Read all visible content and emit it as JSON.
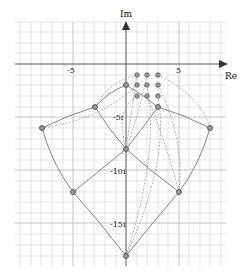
{
  "axes": {
    "x_label": "Re",
    "y_label": "Im",
    "x_ticks": [
      {
        "value": -5,
        "label": "-5"
      },
      {
        "value": 5,
        "label": "5"
      }
    ],
    "y_ticks": [
      {
        "value": -5,
        "label": "-5i"
      },
      {
        "value": -10,
        "label": "-10i"
      },
      {
        "value": -15,
        "label": "-15i"
      }
    ]
  },
  "colors": {
    "grid": "#d8d8d8",
    "axis": "#555555",
    "solid_curve": "#777777",
    "dashed_curve": "#999999",
    "point_fill": "#999999",
    "point_stroke": "#555555"
  },
  "grid_points": [
    {
      "re": 1,
      "im": -1
    },
    {
      "re": 2,
      "im": -1
    },
    {
      "re": 3,
      "im": -1
    },
    {
      "re": 1,
      "im": -2
    },
    {
      "re": 2,
      "im": -2
    },
    {
      "re": 3,
      "im": -2
    },
    {
      "re": 1,
      "im": -3
    },
    {
      "re": 2,
      "im": -3
    },
    {
      "re": 3,
      "im": -3
    }
  ],
  "mapped_points": [
    {
      "re": 0,
      "im": -2
    },
    {
      "re": -3,
      "im": -4
    },
    {
      "re": 3,
      "im": -4
    },
    {
      "re": -8,
      "im": -6
    },
    {
      "re": 8,
      "im": -6
    },
    {
      "re": 0,
      "im": -8
    },
    {
      "re": -5,
      "im": -12
    },
    {
      "re": 5,
      "im": -12
    },
    {
      "re": 0,
      "im": -18
    }
  ]
}
